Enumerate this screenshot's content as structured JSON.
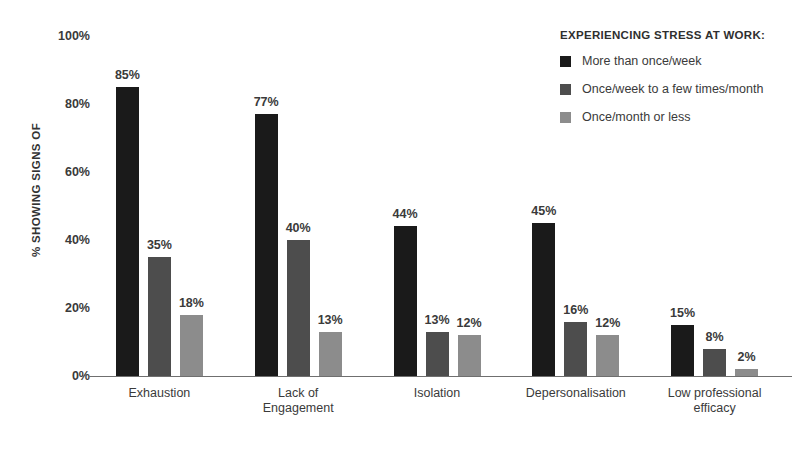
{
  "chart_data": {
    "type": "bar",
    "title": "",
    "xlabel": "",
    "ylabel": "% SHOWING SIGNS OF",
    "ylim": [
      0,
      100
    ],
    "yticks": [
      "0%",
      "20%",
      "40%",
      "60%",
      "80%",
      "100%"
    ],
    "ytick_values": [
      0,
      20,
      40,
      60,
      80,
      100
    ],
    "grid": false,
    "legend_position": "top-right",
    "legend_title": "EXPERIENCING STRESS AT WORK:",
    "categories": [
      "Exhaustion",
      "Lack of\nEngagement",
      "Isolation",
      "Depersonalisation",
      "Low professional\nefficacy"
    ],
    "category_lines": [
      [
        "Exhaustion"
      ],
      [
        "Lack of",
        "Engagement"
      ],
      [
        "Isolation"
      ],
      [
        "Depersonalisation"
      ],
      [
        "Low professional",
        "efficacy"
      ]
    ],
    "series": [
      {
        "name": "More than once/week",
        "color": "#1a1a1a",
        "values": [
          85,
          77,
          44,
          45,
          15
        ],
        "labels": [
          "85%",
          "77%",
          "44%",
          "45%",
          "15%"
        ]
      },
      {
        "name": "Once/week to a few times/month",
        "color": "#4d4d4d",
        "values": [
          35,
          40,
          13,
          16,
          8
        ],
        "labels": [
          "35%",
          "40%",
          "13%",
          "16%",
          "8%"
        ]
      },
      {
        "name": "Once/month or less",
        "color": "#8c8c8c",
        "values": [
          18,
          13,
          12,
          12,
          2
        ],
        "labels": [
          "18%",
          "13%",
          "12%",
          "12%",
          "2%"
        ]
      }
    ]
  },
  "colors": {
    "background": "#ffffff",
    "text": "#3a3a3a",
    "axis": "#6f6f6f",
    "series1": "#1a1a1a",
    "series2": "#4d4d4d",
    "series3": "#8c8c8c"
  }
}
